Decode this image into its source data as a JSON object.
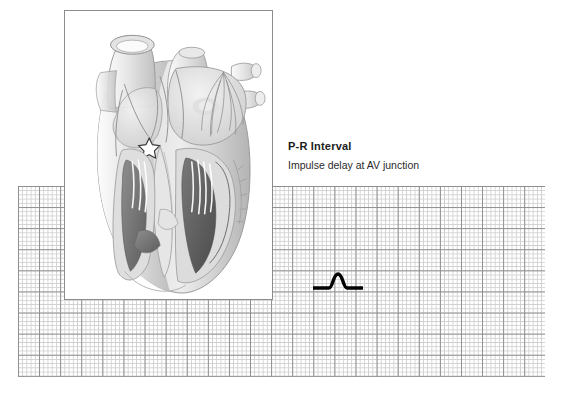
{
  "figure": {
    "caption_title": "P-R Interval",
    "caption_subtitle": "Impulse delay at AV junction",
    "illustration_label": "heart-cutaway-anterior-view",
    "marker_label": "av-junction-star-marker",
    "colors": {
      "background": "#ffffff",
      "grid_minor": "#cfcfcf",
      "grid_major": "#8e8e8e",
      "trace": "#000000",
      "panel_border": "#8c8c8c",
      "title_text": "#1b1b1b",
      "subtitle_text": "#2a2a2a"
    }
  },
  "ecg": {
    "paper_label": "ecg-graph-paper",
    "trace_label": "pr-interval-waveform",
    "waveform_segments": [
      "isoelectric-baseline",
      "p-wave",
      "pr-segment"
    ]
  },
  "anatomy": {
    "parts": [
      "aorta",
      "superior-vena-cava",
      "pulmonary-artery",
      "pulmonary-veins",
      "right-atrium",
      "left-atrium",
      "right-ventricle",
      "left-ventricle",
      "interventricular-septum",
      "papillary-muscles",
      "chordae-tendineae",
      "sa-node",
      "av-node",
      "bundle-of-his",
      "purkinje-fibers"
    ]
  }
}
